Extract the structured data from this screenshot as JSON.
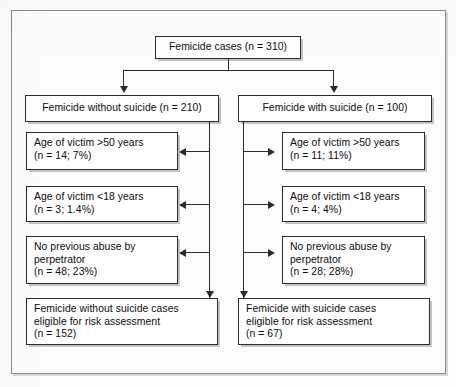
{
  "figure": {
    "type": "flowchart",
    "root": {
      "label": "Femicide cases (n = 310)",
      "n": 310
    },
    "branches": [
      {
        "id": "without-suicide",
        "header": "Femicide without suicide (n = 210)",
        "n": 210,
        "exclusions": [
          {
            "label_line1": "Age of victim >50 years",
            "label_line2": "(n = 14; 7%)",
            "n": 14,
            "percent": "7%"
          },
          {
            "label_line1": "Age of victim <18 years",
            "label_line2": "(n = 3; 1.4%)",
            "n": 3,
            "percent": "1.4%"
          },
          {
            "label_line1": "No previous abuse by",
            "label_line2": "perpetrator",
            "label_line3": "(n = 48; 23%)",
            "n": 48,
            "percent": "23%"
          }
        ],
        "outcome": {
          "label_line1": "Femicide without suicide cases",
          "label_line2": "eligible for risk assessment",
          "label_line3": "(n = 152)",
          "n": 152
        }
      },
      {
        "id": "with-suicide",
        "header": "Femicide with suicide (n = 100)",
        "n": 100,
        "exclusions": [
          {
            "label_line1": "Age of victim >50 years",
            "label_line2": "(n = 11; 11%)",
            "n": 11,
            "percent": "11%"
          },
          {
            "label_line1": "Age of victim <18 years",
            "label_line2": "(n = 4; 4%)",
            "n": 4,
            "percent": "4%"
          },
          {
            "label_line1": "No previous abuse by",
            "label_line2": "perpetrator",
            "label_line3": "(n = 28; 28%)",
            "n": 28,
            "percent": "28%"
          }
        ],
        "outcome": {
          "label_line1": "Femicide with suicide cases",
          "label_line2": "eligible for risk assessment",
          "label_line3": "(n = 67)",
          "n": 67
        }
      }
    ],
    "colors": {
      "box_border": "#2b2b2b",
      "box_fill": "#ffffff",
      "connector": "#2b2b2b",
      "frame": "#8b8b8b",
      "background": "#fdfdfd"
    }
  }
}
